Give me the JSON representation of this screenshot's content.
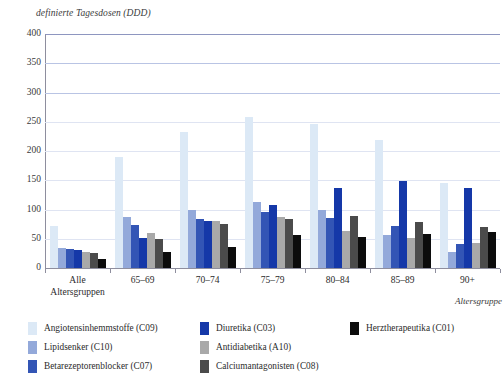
{
  "chart_data": {
    "type": "bar",
    "title": "",
    "ylabel": "definierte Tagesdosen (DDD)",
    "xlabel": "Altersgruppe",
    "ylim": [
      0,
      400
    ],
    "yticks": [
      0,
      50,
      100,
      150,
      200,
      250,
      300,
      350,
      400
    ],
    "grid": true,
    "legend_position": "bottom",
    "categories": [
      "Alle\nAltersgruppen",
      "65–69",
      "70–74",
      "75–79",
      "80–84",
      "85–89",
      "90+"
    ],
    "series": [
      {
        "name": "Angiotensinhemmstoffe (C09)",
        "color": "#dce9f6",
        "values": [
          72,
          190,
          232,
          258,
          247,
          218,
          145
        ]
      },
      {
        "name": "Lipidsenker (C10)",
        "color": "#93a9da",
        "values": [
          35,
          88,
          100,
          112,
          100,
          57,
          28
        ]
      },
      {
        "name": "Betarezeptorenblocker (C07)",
        "color": "#3355b5",
        "values": [
          33,
          74,
          84,
          96,
          85,
          72,
          41
        ]
      },
      {
        "name": "Diuretika (C03)",
        "color": "#1538a8",
        "values": [
          30,
          52,
          80,
          108,
          137,
          148,
          136
        ]
      },
      {
        "name": "Antidiabetika (A10)",
        "color": "#a9a9a9",
        "values": [
          28,
          60,
          80,
          88,
          64,
          51,
          42
        ]
      },
      {
        "name": "Calciumantagonisten (C08)",
        "color": "#4b4b4b",
        "values": [
          25,
          50,
          75,
          84,
          89,
          78,
          70
        ]
      },
      {
        "name": "Herztherapeutika (C01)",
        "color": "#0c0c0c",
        "values": [
          15,
          27,
          36,
          56,
          53,
          58,
          62
        ]
      }
    ]
  },
  "legend": {
    "columns": [
      [
        {
          "label": "Angiotensinhemmstoffe (C09)",
          "color": "#dce9f6"
        },
        {
          "label": "Lipidsenker (C10)",
          "color": "#93a9da"
        },
        {
          "label": "Betarezeptorenblocker (C07)",
          "color": "#3355b5"
        }
      ],
      [
        {
          "label": "Diuretika (C03)",
          "color": "#1538a8"
        },
        {
          "label": "Antidiabetika (A10)",
          "color": "#a9a9a9"
        },
        {
          "label": "Calciumantagonisten (C08)",
          "color": "#4b4b4b"
        }
      ],
      [
        {
          "label": "Herztherapeutika (C01)",
          "color": "#0c0c0c"
        }
      ]
    ]
  },
  "style": {
    "gridline_color": "#b9c4e4",
    "gridline_color_faint": "#dfe4f2",
    "axis_color": "#8e8e9e",
    "background": "#ffffff"
  }
}
